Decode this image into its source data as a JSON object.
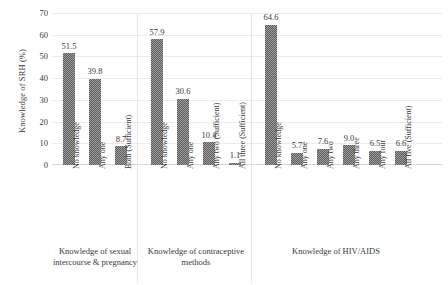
{
  "chart_data": {
    "type": "bar",
    "title": "",
    "xlabel": "",
    "ylabel": "Knowledge of SRH (%)",
    "ylim": [
      0,
      70
    ],
    "ytick_step": 10,
    "yticks": [
      0,
      10,
      20,
      30,
      40,
      50,
      60,
      70
    ],
    "grid": true,
    "legend": "none",
    "bar_color": "#7a7a7a",
    "bar_pattern": "fine-checkerboard",
    "categories": [
      "No knowledge",
      "Any one",
      "Both (Sufficient)",
      "No knowledge",
      "Any one",
      "Any two (Sufficient)",
      "All three (Sufficient)",
      "No knowledge",
      "Any one",
      "Any two",
      "Any three",
      "Any four",
      "All five (Sufficient)"
    ],
    "values": [
      51.5,
      39.8,
      8.7,
      57.9,
      30.6,
      10.4,
      1.1,
      64.6,
      5.7,
      7.6,
      9.0,
      6.5,
      6.6
    ],
    "value_labels": [
      "51.5",
      "39.8",
      "8.7",
      "57.9",
      "30.6",
      "10.4",
      "1.1",
      "64.6",
      "5.7",
      "7.6",
      "9.0",
      "6.5",
      "6.6"
    ],
    "groups": [
      {
        "label": "Knowledge of sexual intercourse & pregnancy",
        "label_line1": "Knowledge of sexual",
        "label_line2": "intercourse & pregnancy",
        "start_index": 0,
        "count": 3
      },
      {
        "label": "Knowledge of contraceptive methods",
        "label_line1": "Knowledge of contraceptive",
        "label_line2": "methods",
        "start_index": 3,
        "count": 4
      },
      {
        "label": "Knowledge of  HIV/AIDS",
        "label_line1": "Knowledge of  HIV/AIDS",
        "label_line2": "",
        "start_index": 7,
        "count": 6
      }
    ]
  }
}
